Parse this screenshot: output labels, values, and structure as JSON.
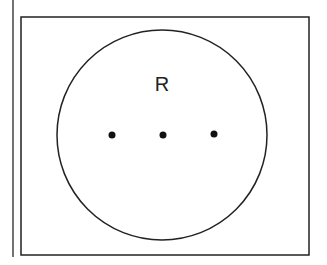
{
  "diagram": {
    "type": "venn-set",
    "universe": {
      "shape": "rectangle",
      "x": 21,
      "y": 17,
      "width": 288,
      "height": 238
    },
    "set": {
      "label": "R",
      "shape": "circle",
      "cx": 162,
      "cy": 135,
      "r": 105
    },
    "points": [
      {
        "cx": 112,
        "cy": 135
      },
      {
        "cx": 163,
        "cy": 135
      },
      {
        "cx": 214,
        "cy": 134
      }
    ],
    "margin_line": {
      "x": 13,
      "y1": 0,
      "y2": 257
    },
    "colors": {
      "stroke": "#222222",
      "fill": "#ffffff",
      "point": "#111111"
    }
  }
}
